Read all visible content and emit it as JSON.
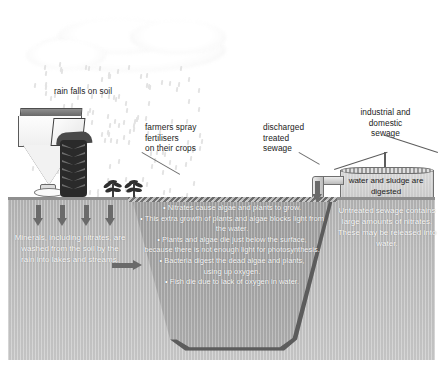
{
  "diagram": {
    "labels": {
      "rain": "rain falls on soil",
      "farmers": "farmers spray\nfertilisers\non their crops",
      "discharged": "discharged\ntreated\nsewage",
      "industrial": "industrial and\ndomestic\nsewage",
      "tank": "water and sludge\nare digested"
    },
    "soil_text": "Minerals, including nitrates, are washed from the soil by the rain into lakes and streams.",
    "sewage_text": "Untreated sewage contains large amounts of nitrates. These may be released into water.",
    "lake_bullets": [
      "• Nitrates cause algae and plants to grow.",
      "• This extra growth of plants and algae blocks light from the water.",
      "• Plants and algae die just below the surface, because there is not enough light for photosynthesis.",
      "• Bacteria digest the dead algae and plants, using up oxygen.",
      "• Fish die due to lack of oxygen in water."
    ],
    "colors": {
      "background": "#ffffff",
      "soil": "#b7b7b7",
      "water": "#9f9f9f",
      "arrow": "#6a6a6a",
      "text_dark": "#1b1b1b",
      "text_light": "#ffffff",
      "outline": "#5c5c5c"
    },
    "icons": {
      "tractor": "tractor-spreader-icon",
      "cloud": "cloud-icon",
      "rain": "raindrops-icon",
      "crop": "crop-plant-icon",
      "tank": "sewage-tank-icon",
      "pipe": "outfall-pipe-icon",
      "arrow_down": "down-arrow-icon",
      "arrow_right": "right-arrow-icon"
    }
  }
}
